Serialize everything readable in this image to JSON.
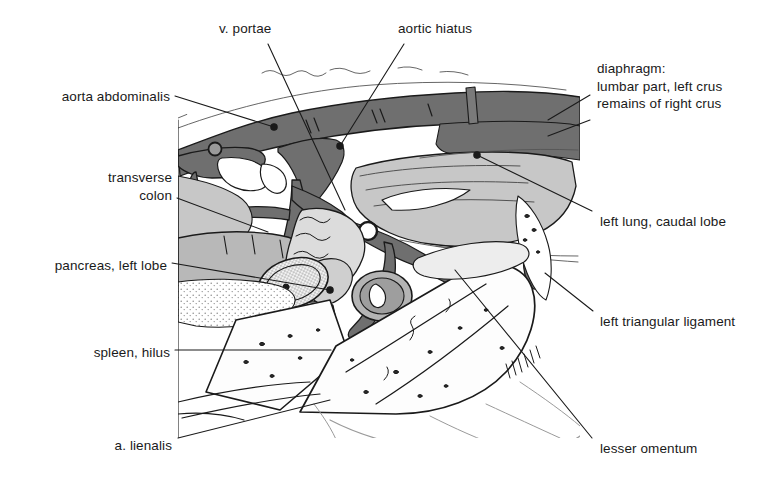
{
  "figure": {
    "type": "anatomical-illustration",
    "style": "black-and-white line drawing with gray tonal fills",
    "palette": {
      "ink": "#1a1a1a",
      "dark_gray": "#6f6f6f",
      "mid_gray": "#9a9a9a",
      "light_gray": "#c7c7c7",
      "pale_gray": "#e2e2e2",
      "background": "#ffffff"
    }
  },
  "labels": [
    {
      "id": "v-portae",
      "text": "v. portae",
      "align": "left",
      "x": 219,
      "y": 20,
      "leader": [
        [
          268,
          44
        ],
        [
          345,
          210
        ]
      ]
    },
    {
      "id": "aortic-hiatus",
      "text": "aortic hiatus",
      "align": "left",
      "x": 398,
      "y": 20,
      "leader": [
        [
          404,
          44
        ],
        [
          340,
          146
        ]
      ]
    },
    {
      "id": "aorta-abdominalis",
      "text": "aorta abdominalis",
      "align": "right",
      "x": 40,
      "y": 88,
      "leader": [
        [
          175,
          96
        ],
        [
          274,
          127
        ]
      ]
    },
    {
      "id": "diaphragm-block",
      "text": "diaphragm:\nlumbar part, left crus\nremains of right crus",
      "align": "left",
      "x": 597,
      "y": 60,
      "leader": [
        [
          590,
          95
        ],
        [
          548,
          120
        ]
      ],
      "leader2": [
        [
          590,
          120
        ],
        [
          548,
          136
        ]
      ]
    },
    {
      "id": "transverse-colon",
      "text": "transverse\ncolon",
      "align": "right",
      "x": 40,
      "y": 169,
      "leader": [
        [
          177,
          198
        ],
        [
          268,
          232
        ]
      ]
    },
    {
      "id": "left-lung-caudal-lobe",
      "text": "left lung, caudal lobe",
      "align": "left",
      "x": 600,
      "y": 213,
      "leader": [
        [
          592,
          211
        ],
        [
          477,
          155
        ]
      ]
    },
    {
      "id": "pancreas-left-lobe",
      "text": "pancreas, left lobe",
      "align": "right",
      "x": 36,
      "y": 257,
      "leader": [
        [
          172,
          263
        ],
        [
          330,
          290
        ]
      ]
    },
    {
      "id": "left-triangular-ligament",
      "text": "left triangular ligament",
      "align": "left",
      "x": 600,
      "y": 313,
      "leader": [
        [
          593,
          311
        ],
        [
          545,
          273
        ]
      ]
    },
    {
      "id": "spleen-hilus",
      "text": "spleen, hilus",
      "align": "right",
      "x": 72,
      "y": 344,
      "leader": [
        [
          175,
          350
        ],
        [
          331,
          350
        ]
      ]
    },
    {
      "id": "a-lienalis",
      "text": "a. lienalis",
      "align": "right",
      "x": 90,
      "y": 437,
      "leader": [
        [
          178,
          438
        ],
        [
          330,
          400
        ]
      ]
    },
    {
      "id": "lesser-omentum",
      "text": "lesser omentum",
      "align": "left",
      "x": 600,
      "y": 440,
      "leader": [
        [
          592,
          438
        ],
        [
          455,
          270
        ]
      ]
    }
  ]
}
